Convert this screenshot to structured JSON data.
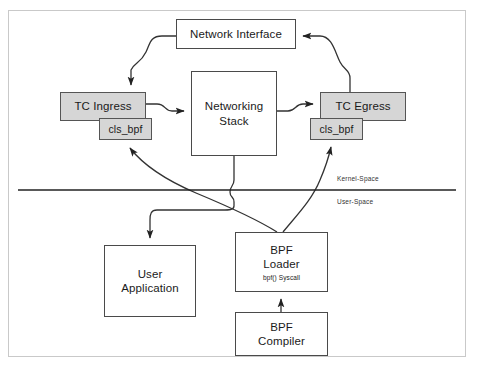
{
  "diagram": {
    "colors": {
      "gray_box_fill": "#d6d6d6",
      "box_stroke": "#4a4a4a",
      "wire_stroke": "#333333",
      "frame_border": "#c9c9c9",
      "background": "#ffffff"
    },
    "nodes": {
      "network_interface": {
        "label": "Network Interface"
      },
      "tc_ingress": {
        "label": "TC Ingress",
        "shaded": true
      },
      "cls_bpf_ingress": {
        "label": "cls_bpf",
        "shaded": true
      },
      "networking_stack": {
        "line1": "Networking",
        "line2": "Stack"
      },
      "tc_egress": {
        "label": "TC Egress",
        "shaded": true
      },
      "cls_bpf_egress": {
        "label": "cls_bpf",
        "shaded": true
      },
      "user_application": {
        "line1": "User",
        "line2": "Application"
      },
      "bpf_loader": {
        "line1": "BPF",
        "line2": "Loader",
        "sublabel": "bpf() Syscall"
      },
      "bpf_compiler": {
        "line1": "BPF",
        "line2": "Compiler"
      }
    },
    "separator": {
      "kernel_space_label": "Kernel-Space",
      "user_space_label": "User-Space"
    },
    "edges": [
      {
        "name": "network-interface-to-tc-ingress",
        "from": "network_interface",
        "to": "tc_ingress",
        "arrow": true
      },
      {
        "name": "tc-ingress-to-networking-stack",
        "from": "tc_ingress",
        "to": "networking_stack",
        "arrow": true
      },
      {
        "name": "networking-stack-to-tc-egress",
        "from": "networking_stack",
        "to": "tc_egress",
        "arrow": true
      },
      {
        "name": "tc-egress-to-network-interface",
        "from": "tc_egress",
        "to": "network_interface",
        "arrow": true
      },
      {
        "name": "bpf-loader-to-cls-bpf-ingress",
        "from": "bpf_loader",
        "to": "cls_bpf_ingress",
        "arrow": true
      },
      {
        "name": "bpf-loader-to-cls-bpf-egress",
        "from": "bpf_loader",
        "to": "cls_bpf_egress",
        "arrow": true
      },
      {
        "name": "networking-stack-to-user-application",
        "from": "networking_stack",
        "to": "user_application",
        "arrow": true
      },
      {
        "name": "bpf-compiler-to-bpf-loader",
        "from": "bpf_compiler",
        "to": "bpf_loader",
        "arrow": true
      }
    ]
  }
}
